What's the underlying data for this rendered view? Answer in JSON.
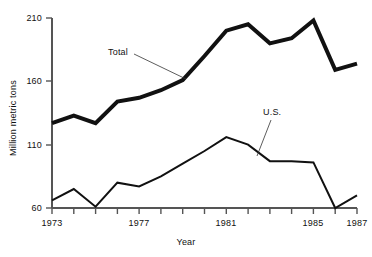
{
  "chart_data": {
    "type": "line",
    "title": "",
    "xlabel": "Year",
    "ylabel": "Million metric tons",
    "xlim": [
      1973,
      1987
    ],
    "ylim": [
      60,
      210
    ],
    "grid": false,
    "legend_position": "inline-annotations",
    "x": [
      1973,
      1974,
      1975,
      1976,
      1977,
      1978,
      1979,
      1980,
      1981,
      1982,
      1983,
      1984,
      1985,
      1986,
      1987
    ],
    "y_ticks": [
      60,
      110,
      160,
      210
    ],
    "y_tick_labels": [
      "60",
      "110",
      "160",
      "210"
    ],
    "x_ticks": [
      1973,
      1974,
      1975,
      1976,
      1977,
      1978,
      1979,
      1980,
      1981,
      1982,
      1983,
      1984,
      1985,
      1986,
      1987
    ],
    "x_tick_labels_shown": [
      {
        "value": 1973,
        "label": "1973"
      },
      {
        "value": 1977,
        "label": "1977"
      },
      {
        "value": 1981,
        "label": "1981"
      },
      {
        "value": 1985,
        "label": "1985"
      },
      {
        "value": 1987,
        "label": "1987"
      }
    ],
    "series": [
      {
        "name": "Total",
        "label": "Total",
        "color": "#111111",
        "line_width": 4,
        "values": [
          127,
          133,
          127,
          144,
          147,
          153,
          161,
          180,
          200,
          205,
          190,
          194,
          208,
          169,
          174
        ]
      },
      {
        "name": "U.S.",
        "label": "U.S.",
        "color": "#111111",
        "line_width": 2,
        "values": [
          66,
          75,
          61,
          80,
          77,
          85,
          95,
          105,
          116,
          110,
          97,
          97,
          96,
          60,
          70
        ]
      }
    ],
    "annotations": [
      {
        "text": "Total",
        "series": "Total",
        "anchor_x": 1978.3,
        "anchor_y": 161
      },
      {
        "text": "U.S.",
        "series": "U.S.",
        "anchor_x": 1982.6,
        "anchor_y": 100
      }
    ]
  },
  "axes": {
    "y_title": "Million metric tons",
    "x_title": "Year",
    "y_labels": [
      "210",
      "160",
      "110",
      "60"
    ],
    "x_labels": [
      "1973",
      "1977",
      "1981",
      "1985",
      "1987"
    ]
  },
  "labels": {
    "total": "Total",
    "us": "U.S."
  },
  "colors": {
    "background": "#ffffff",
    "ink": "#111111",
    "axis": "#555555"
  }
}
